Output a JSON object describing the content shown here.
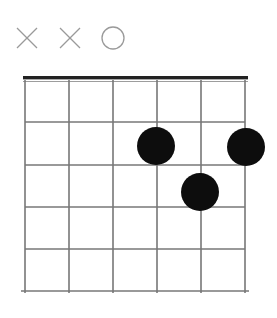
{
  "diagram": {
    "type": "guitar-chord-diagram",
    "width": 277,
    "height": 318,
    "background_color": "#ffffff",
    "string_count": 6,
    "fret_count": 5,
    "starting_fret": 1,
    "nut_shown": true,
    "fret_position_label": "",
    "chord_name": ""
  },
  "geometry": {
    "string_x": [
      25,
      69,
      113,
      157,
      201,
      245
    ],
    "fret_y": [
      81,
      122,
      165,
      207,
      249,
      291
    ],
    "nut_y": 80,
    "nut_left": 23,
    "nut_right": 248,
    "nut_thickness": 4,
    "marker_row_y": 38,
    "dot_radius": 19,
    "grid_line_color": "#777777",
    "grid_line_width": 1.6,
    "nut_color": "#222222",
    "dot_color": "#0d0d0d",
    "marker_color": "#9a9a9a",
    "marker_stroke_width": 1.3,
    "marker_size": 20
  },
  "open_markers": [
    {
      "id": "marker-string-1",
      "string": 1,
      "string_name": "low-E",
      "symbol": "X",
      "meaning": "muted",
      "x": 27,
      "y": 38
    },
    {
      "id": "marker-string-2",
      "string": 2,
      "string_name": "A",
      "symbol": "X",
      "meaning": "muted",
      "x": 70,
      "y": 38
    },
    {
      "id": "marker-string-3",
      "string": 3,
      "string_name": "D",
      "symbol": "O",
      "meaning": "open",
      "x": 113,
      "y": 38
    }
  ],
  "finger_dots": [
    {
      "id": "dot-1",
      "string": 4,
      "fret": 2,
      "x": 156,
      "y": 146,
      "radius": 19,
      "label": ""
    },
    {
      "id": "dot-2",
      "string": 6,
      "fret": 2,
      "x": 246,
      "y": 147,
      "radius": 19,
      "label": ""
    },
    {
      "id": "dot-3",
      "string": 5,
      "fret": 3,
      "x": 200,
      "y": 192,
      "radius": 19,
      "label": ""
    }
  ],
  "chart_data": {
    "type": "table",
    "categories": [
      "String 1 (low E)",
      "String 2 (A)",
      "String 3 (D)",
      "String 4 (G)",
      "String 5 (B)",
      "String 6 (high E)"
    ],
    "values": [
      "X",
      "X",
      "O",
      "2",
      "3",
      "2"
    ],
    "xlabel": "String",
    "ylabel": "Fret"
  }
}
